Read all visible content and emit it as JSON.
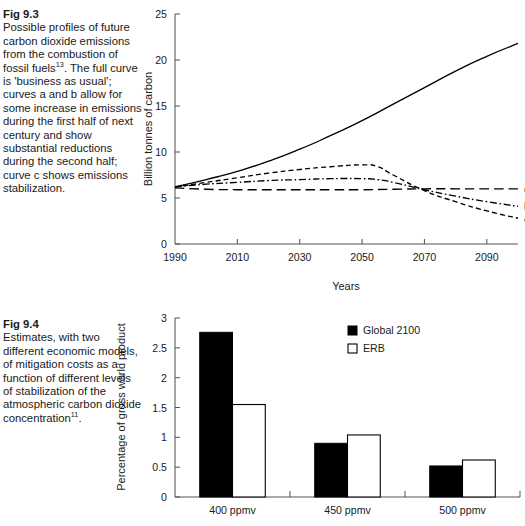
{
  "figures": [
    {
      "id": "fig-9-3",
      "caption_head": "Fig 9.3",
      "caption_body_1": "Possible profiles of future carbon dioxide emissions from the combustion of fossil fuels",
      "caption_sup_1": "13",
      "caption_body_2": ". The full curve is 'business as usual'; curves a and b allow for some increase in emissions during the first half of next century and show substantial reductions during the second half; curve c shows emissions stabilization."
    },
    {
      "id": "fig-9-4",
      "caption_head": "Fig 9.4",
      "caption_body_1": "Estimates, with two different economic models, of mitigation costs as a function of different levels of stabilization of the atmospheric carbon dioxide concentration",
      "caption_sup_1": "11",
      "caption_body_2": "."
    }
  ],
  "chart_data": [
    {
      "type": "line",
      "id": "emissions-profiles",
      "title": "",
      "xlabel": "Years",
      "ylabel": "Billion tonnes of carbon",
      "xlim": [
        1990,
        2100
      ],
      "ylim": [
        0,
        25
      ],
      "xticks": [
        1990,
        2010,
        2030,
        2050,
        2070,
        2090
      ],
      "xtick_labels": [
        "1990",
        "2010",
        "2030",
        "2050",
        "2070",
        "2090"
      ],
      "yticks": [
        0,
        5,
        10,
        15,
        20,
        25
      ],
      "ytick_labels": [
        "0",
        "5",
        "10",
        "15",
        "20",
        "25"
      ],
      "grid": false,
      "legend_position": "right-inline-end-labels",
      "series": [
        {
          "name": "business as usual",
          "label": "",
          "style": "solid",
          "x": [
            1990,
            2000,
            2010,
            2020,
            2030,
            2040,
            2050,
            2060,
            2070,
            2080,
            2090,
            2100
          ],
          "values": [
            6.2,
            7.0,
            7.9,
            9.0,
            10.3,
            11.8,
            13.4,
            15.2,
            17.0,
            18.8,
            20.4,
            21.8
          ]
        },
        {
          "name": "curve a",
          "label": "a",
          "style": "dashed-short",
          "x": [
            1990,
            2000,
            2010,
            2020,
            2030,
            2040,
            2050,
            2055,
            2060,
            2070,
            2080,
            2090,
            2100
          ],
          "values": [
            6.2,
            6.7,
            7.2,
            7.7,
            8.1,
            8.4,
            8.6,
            8.4,
            7.5,
            5.8,
            4.6,
            3.6,
            2.8
          ]
        },
        {
          "name": "curve b",
          "label": "b",
          "style": "dash-dot",
          "x": [
            1990,
            2000,
            2010,
            2020,
            2030,
            2040,
            2050,
            2055,
            2060,
            2070,
            2080,
            2090,
            2100
          ],
          "values": [
            6.2,
            6.5,
            6.7,
            6.9,
            7.0,
            7.1,
            7.1,
            7.0,
            6.7,
            5.9,
            5.2,
            4.6,
            4.1
          ]
        },
        {
          "name": "curve c",
          "label": "c",
          "style": "dashed-long",
          "x": [
            1990,
            2000,
            2010,
            2020,
            2030,
            2040,
            2050,
            2060,
            2070,
            2080,
            2090,
            2100
          ],
          "values": [
            6.1,
            5.95,
            5.9,
            5.9,
            5.9,
            5.9,
            5.9,
            5.95,
            6.0,
            6.0,
            6.0,
            6.0
          ]
        }
      ]
    },
    {
      "type": "bar",
      "id": "mitigation-costs",
      "title": "",
      "xlabel": "",
      "ylabel": "Percentage of gross world product",
      "categories": [
        "400 ppmv",
        "450 ppmv",
        "500 ppmv"
      ],
      "ylim": [
        0,
        3
      ],
      "yticks": [
        0,
        0.5,
        1,
        1.5,
        2,
        2.5,
        3
      ],
      "ytick_labels": [
        "0",
        "0.5",
        "1",
        "1.5",
        "2",
        "2.5",
        "3"
      ],
      "grid": false,
      "legend_position": "top-right",
      "series": [
        {
          "name": "Global 2100",
          "swatch": "filled",
          "values": [
            2.76,
            0.9,
            0.52
          ]
        },
        {
          "name": "ERB",
          "swatch": "open",
          "values": [
            1.55,
            1.04,
            0.62
          ]
        }
      ]
    }
  ],
  "colors": {
    "ink": "#141414",
    "axis": "#555555",
    "bar_filled": "#000000",
    "bar_open": "#ffffff",
    "background": "#ffffff"
  }
}
